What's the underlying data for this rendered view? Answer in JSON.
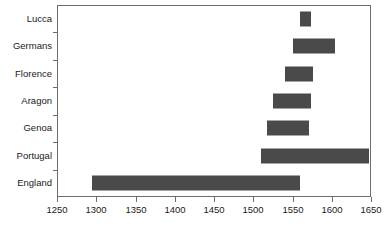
{
  "chart_data": {
    "type": "bar",
    "orientation": "horizontal",
    "bar_style": "range",
    "title": "",
    "subtitle": "",
    "xlabel": "",
    "ylabel": "",
    "xlim": [
      1250,
      1650
    ],
    "xticks": [
      1250,
      1300,
      1350,
      1400,
      1450,
      1500,
      1550,
      1600,
      1650
    ],
    "xtick_labels": [
      "1250",
      "1300",
      "1350",
      "1400",
      "1450",
      "1500",
      "1550",
      "1600",
      "1650"
    ],
    "grid": false,
    "legend": null,
    "bar_color": "#4a4a4a",
    "axis_color": "#6d6d6d",
    "background": "#ffffff",
    "categories": [
      "Lucca",
      "Germans",
      "Florence",
      "Aragon",
      "Genoa",
      "Portugal",
      "England"
    ],
    "series": [
      {
        "name": "Period of activity",
        "ranges": [
          {
            "category": "Lucca",
            "start": 1559,
            "end": 1574
          },
          {
            "category": "Germans",
            "start": 1550,
            "end": 1604
          },
          {
            "category": "Florence",
            "start": 1541,
            "end": 1576
          },
          {
            "category": "Aragon",
            "start": 1525,
            "end": 1574
          },
          {
            "category": "Genoa",
            "start": 1518,
            "end": 1571
          },
          {
            "category": "Portugal",
            "start": 1510,
            "end": 1648
          },
          {
            "category": "England",
            "start": 1294,
            "end": 1559
          }
        ]
      }
    ]
  }
}
